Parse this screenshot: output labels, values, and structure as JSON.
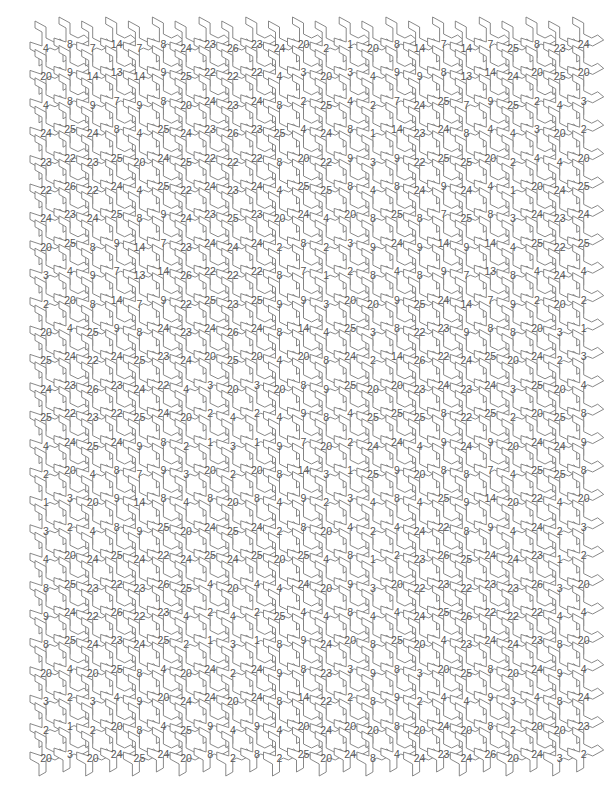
{
  "page": {
    "background_color": "#ffffff",
    "line_color": "#7a7a7a",
    "number_color": "#555555"
  },
  "grid": {
    "origin_x": 46,
    "origin_y": 48,
    "column_pitch": 46.7,
    "row_pitch": 28.4,
    "sub_offset_x": 24,
    "sub_offset_y": -4,
    "columns": 12,
    "rows": 26
  },
  "columns": [
    {
      "left": [
        "4",
        "20",
        "4",
        "24",
        "23",
        "22",
        "24",
        "20",
        "3",
        "2",
        "20",
        "25",
        "24",
        "25",
        "4",
        "2",
        "1",
        "3",
        "4",
        "8",
        "9",
        "8",
        "20",
        "3",
        "2",
        "20"
      ],
      "right": [
        "8",
        "9",
        "8",
        "25",
        "22",
        "26",
        "23",
        "25",
        "4",
        "20",
        "4",
        "24",
        "23",
        "22",
        "24",
        "20",
        "3",
        "2",
        "20",
        "25",
        "24",
        "25",
        "4",
        "2",
        "1",
        "3"
      ]
    },
    {
      "left": [
        "7",
        "14",
        "9",
        "24",
        "23",
        "22",
        "24",
        "8",
        "9",
        "8",
        "25",
        "22",
        "26",
        "23",
        "25",
        "4",
        "20",
        "4",
        "24",
        "23",
        "22",
        "24",
        "20",
        "3",
        "2",
        "20"
      ],
      "right": [
        "14",
        "13",
        "7",
        "8",
        "25",
        "24",
        "25",
        "9",
        "7",
        "14",
        "9",
        "24",
        "23",
        "22",
        "24",
        "8",
        "9",
        "8",
        "25",
        "22",
        "26",
        "23",
        "25",
        "4",
        "20",
        "24"
      ]
    },
    {
      "left": [
        "7",
        "14",
        "9",
        "4",
        "20",
        "4",
        "8",
        "14",
        "13",
        "7",
        "8",
        "25",
        "24",
        "25",
        "9",
        "7",
        "14",
        "9",
        "24",
        "23",
        "22",
        "24",
        "8",
        "9",
        "8",
        "25"
      ],
      "right": [
        "8",
        "9",
        "8",
        "25",
        "24",
        "25",
        "9",
        "7",
        "14",
        "9",
        "24",
        "23",
        "22",
        "24",
        "8",
        "9",
        "8",
        "25",
        "22",
        "26",
        "23",
        "25",
        "4",
        "20",
        "4",
        "24"
      ]
    },
    {
      "left": [
        "24",
        "25",
        "20",
        "24",
        "25",
        "22",
        "24",
        "23",
        "26",
        "22",
        "23",
        "24",
        "4",
        "20",
        "2",
        "3",
        "4",
        "20",
        "24",
        "25",
        "4",
        "2",
        "20",
        "24",
        "25",
        "20"
      ],
      "right": [
        "23",
        "22",
        "24",
        "23",
        "22",
        "24",
        "23",
        "24",
        "22",
        "25",
        "24",
        "20",
        "3",
        "2",
        "1",
        "20",
        "8",
        "24",
        "25",
        "4",
        "2",
        "1",
        "24",
        "24",
        "9",
        "8"
      ]
    },
    {
      "left": [
        "26",
        "22",
        "23",
        "26",
        "22",
        "23",
        "25",
        "24",
        "22",
        "23",
        "26",
        "25",
        "20",
        "4",
        "3",
        "2",
        "20",
        "25",
        "24",
        "20",
        "4",
        "3",
        "2",
        "20",
        "4",
        "2"
      ],
      "right": [
        "23",
        "22",
        "24",
        "23",
        "22",
        "24",
        "23",
        "24",
        "22",
        "25",
        "24",
        "20",
        "3",
        "2",
        "1",
        "20",
        "8",
        "24",
        "25",
        "4",
        "2",
        "1",
        "24",
        "24",
        "9",
        "8"
      ]
    },
    {
      "left": [
        "24",
        "4",
        "8",
        "25",
        "8",
        "4",
        "20",
        "2",
        "8",
        "9",
        "8",
        "4",
        "20",
        "4",
        "9",
        "8",
        "4",
        "2",
        "20",
        "4",
        "25",
        "8",
        "9",
        "8",
        "4",
        "2"
      ],
      "right": [
        "20",
        "3",
        "2",
        "4",
        "20",
        "25",
        "24",
        "8",
        "7",
        "9",
        "14",
        "20",
        "8",
        "9",
        "7",
        "14",
        "9",
        "8",
        "25",
        "24",
        "4",
        "9",
        "8",
        "14",
        "20",
        "25"
      ]
    },
    {
      "left": [
        "2",
        "20",
        "25",
        "24",
        "22",
        "25",
        "4",
        "2",
        "1",
        "3",
        "4",
        "8",
        "9",
        "8",
        "20",
        "3",
        "2",
        "20",
        "4",
        "20",
        "4",
        "24",
        "23",
        "22",
        "24",
        "20"
      ],
      "right": [
        "1",
        "3",
        "4",
        "8",
        "9",
        "8",
        "20",
        "3",
        "2",
        "20",
        "25",
        "24",
        "25",
        "4",
        "2",
        "1",
        "3",
        "4",
        "8",
        "9",
        "8",
        "20",
        "3",
        "2",
        "20",
        "24"
      ]
    },
    {
      "left": [
        "20",
        "4",
        "2",
        "1",
        "3",
        "4",
        "8",
        "9",
        "8",
        "20",
        "3",
        "2",
        "20",
        "25",
        "24",
        "25",
        "4",
        "2",
        "1",
        "3",
        "4",
        "8",
        "9",
        "8",
        "20",
        "8"
      ],
      "right": [
        "8",
        "9",
        "7",
        "14",
        "9",
        "8",
        "25",
        "24",
        "4",
        "9",
        "8",
        "14",
        "20",
        "25",
        "24",
        "9",
        "8",
        "4",
        "2",
        "20",
        "4",
        "25",
        "8",
        "9",
        "8",
        "4"
      ]
    },
    {
      "left": [
        "14",
        "9",
        "24",
        "23",
        "22",
        "24",
        "8",
        "9",
        "8",
        "25",
        "22",
        "26",
        "23",
        "25",
        "4",
        "20",
        "4",
        "24",
        "23",
        "22",
        "24",
        "20",
        "3",
        "2",
        "20",
        "24"
      ],
      "right": [
        "7",
        "8",
        "25",
        "24",
        "25",
        "9",
        "7",
        "14",
        "9",
        "24",
        "23",
        "22",
        "24",
        "8",
        "9",
        "8",
        "25",
        "22",
        "26",
        "23",
        "25",
        "4",
        "20",
        "4",
        "24",
        "23"
      ]
    },
    {
      "left": [
        "14",
        "13",
        "7",
        "8",
        "25",
        "24",
        "25",
        "9",
        "7",
        "14",
        "9",
        "24",
        "23",
        "22",
        "24",
        "8",
        "9",
        "8",
        "25",
        "22",
        "26",
        "23",
        "25",
        "4",
        "20",
        "24"
      ],
      "right": [
        "7",
        "14",
        "9",
        "4",
        "20",
        "4",
        "8",
        "14",
        "13",
        "7",
        "8",
        "25",
        "24",
        "25",
        "9",
        "7",
        "14",
        "9",
        "24",
        "23",
        "22",
        "24",
        "8",
        "9",
        "8",
        "26"
      ]
    },
    {
      "left": [
        "25",
        "24",
        "25",
        "4",
        "2",
        "1",
        "3",
        "4",
        "8",
        "9",
        "8",
        "20",
        "3",
        "2",
        "20",
        "4",
        "20",
        "4",
        "24",
        "23",
        "22",
        "24",
        "20",
        "3",
        "2",
        "20"
      ],
      "right": [
        "8",
        "20",
        "2",
        "3",
        "4",
        "20",
        "24",
        "25",
        "4",
        "2",
        "20",
        "24",
        "25",
        "20",
        "24",
        "25",
        "22",
        "24",
        "23",
        "26",
        "22",
        "23",
        "24",
        "4",
        "20",
        "24"
      ]
    },
    {
      "left": [
        "23",
        "25",
        "4",
        "20",
        "4",
        "24",
        "23",
        "22",
        "24",
        "20",
        "3",
        "2",
        "20",
        "25",
        "24",
        "25",
        "4",
        "2",
        "1",
        "3",
        "4",
        "8",
        "9",
        "8",
        "20",
        "3"
      ],
      "right": [
        "24",
        "20",
        "3",
        "2",
        "20",
        "25",
        "24",
        "25",
        "4",
        "2",
        "1",
        "3",
        "4",
        "8",
        "9",
        "8",
        "20",
        "3",
        "2",
        "20",
        "4",
        "20",
        "4",
        "24",
        "23",
        "2"
      ]
    }
  ]
}
